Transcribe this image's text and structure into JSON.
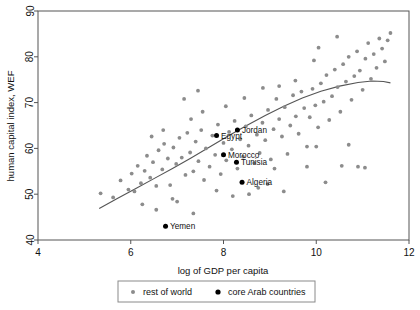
{
  "chart_data": {
    "type": "scatter",
    "title": "",
    "xlabel": "log of GDP per capita",
    "ylabel": "human capital index, WEF",
    "xlim": [
      4,
      12
    ],
    "ylim": [
      40,
      90
    ],
    "xticks": [
      4,
      6,
      8,
      10,
      12
    ],
    "yticks": [
      40,
      50,
      60,
      70,
      80,
      90
    ],
    "grid": false,
    "legend_position": "below-axis",
    "legend": [
      {
        "name": "rest of world",
        "marker": "dot",
        "color": "#8c8c8c",
        "size": 2.0
      },
      {
        "name": "core Arab countries",
        "marker": "dot",
        "color": "#000000",
        "size": 2.6
      }
    ],
    "series": [
      {
        "name": "rest of world",
        "color": "#8c8c8c",
        "points": [
          [
            5.35,
            50.2
          ],
          [
            5.62,
            49.3
          ],
          [
            5.78,
            53.0
          ],
          [
            5.95,
            51.0
          ],
          [
            6.02,
            54.5
          ],
          [
            6.08,
            50.6
          ],
          [
            6.15,
            56.2
          ],
          [
            6.22,
            52.4
          ],
          [
            6.3,
            55.1
          ],
          [
            6.35,
            58.4
          ],
          [
            6.42,
            53.6
          ],
          [
            6.48,
            57.0
          ],
          [
            6.55,
            51.8
          ],
          [
            6.6,
            59.6
          ],
          [
            6.68,
            55.4
          ],
          [
            6.72,
            61.0
          ],
          [
            6.8,
            57.8
          ],
          [
            6.85,
            52.0
          ],
          [
            6.92,
            60.2
          ],
          [
            6.98,
            56.6
          ],
          [
            7.05,
            62.3
          ],
          [
            7.1,
            58.0
          ],
          [
            7.18,
            54.2
          ],
          [
            7.22,
            63.4
          ],
          [
            7.28,
            59.1
          ],
          [
            7.35,
            55.0
          ],
          [
            7.4,
            61.5
          ],
          [
            7.46,
            57.2
          ],
          [
            7.52,
            64.0
          ],
          [
            7.58,
            53.1
          ],
          [
            7.62,
            60.0
          ],
          [
            7.7,
            56.0
          ],
          [
            7.76,
            62.8
          ],
          [
            7.82,
            58.6
          ],
          [
            7.88,
            65.2
          ],
          [
            7.94,
            54.4
          ],
          [
            8.0,
            61.2
          ],
          [
            8.06,
            57.4
          ],
          [
            8.12,
            63.6
          ],
          [
            8.18,
            59.8
          ],
          [
            8.24,
            66.0
          ],
          [
            8.3,
            55.6
          ],
          [
            8.36,
            62.0
          ],
          [
            8.42,
            58.2
          ],
          [
            8.48,
            64.8
          ],
          [
            8.54,
            60.6
          ],
          [
            8.6,
            67.2
          ],
          [
            8.66,
            56.8
          ],
          [
            8.72,
            63.0
          ],
          [
            8.78,
            59.0
          ],
          [
            8.84,
            65.6
          ],
          [
            8.9,
            61.8
          ],
          [
            8.96,
            68.4
          ],
          [
            9.02,
            57.6
          ],
          [
            9.08,
            64.2
          ],
          [
            9.14,
            70.8
          ],
          [
            9.2,
            66.4
          ],
          [
            9.26,
            62.6
          ],
          [
            9.32,
            69.0
          ],
          [
            9.38,
            58.8
          ],
          [
            9.44,
            65.0
          ],
          [
            9.5,
            71.6
          ],
          [
            9.56,
            67.0
          ],
          [
            9.62,
            63.2
          ],
          [
            9.68,
            72.4
          ],
          [
            9.74,
            68.8
          ],
          [
            9.8,
            60.4
          ],
          [
            9.86,
            66.8
          ],
          [
            9.92,
            73.0
          ],
          [
            9.98,
            69.4
          ],
          [
            10.04,
            64.6
          ],
          [
            10.1,
            74.2
          ],
          [
            10.16,
            70.2
          ],
          [
            10.22,
            76.0
          ],
          [
            10.28,
            66.2
          ],
          [
            10.34,
            71.4
          ],
          [
            10.4,
            77.2
          ],
          [
            10.46,
            73.4
          ],
          [
            10.52,
            68.0
          ],
          [
            10.58,
            78.4
          ],
          [
            10.64,
            74.6
          ],
          [
            10.7,
            80.0
          ],
          [
            10.76,
            70.6
          ],
          [
            10.82,
            75.8
          ],
          [
            10.88,
            81.2
          ],
          [
            10.94,
            77.0
          ],
          [
            11.0,
            72.8
          ],
          [
            11.06,
            79.6
          ],
          [
            11.12,
            83.0
          ],
          [
            11.18,
            75.2
          ],
          [
            11.24,
            80.6
          ],
          [
            11.3,
            77.6
          ],
          [
            11.36,
            84.0
          ],
          [
            11.42,
            81.8
          ],
          [
            11.48,
            79.0
          ],
          [
            11.54,
            83.6
          ],
          [
            11.6,
            85.2
          ],
          [
            10.05,
            82.0
          ],
          [
            10.45,
            84.4
          ],
          [
            9.95,
            79.2
          ],
          [
            6.25,
            47.8
          ],
          [
            6.55,
            46.6
          ],
          [
            7.0,
            48.4
          ],
          [
            7.35,
            45.8
          ],
          [
            6.9,
            49.0
          ],
          [
            9.1,
            55.6
          ],
          [
            9.8,
            56.0
          ],
          [
            10.55,
            56.2
          ],
          [
            10.9,
            56.0
          ],
          [
            11.05,
            55.8
          ],
          [
            10.0,
            60.4
          ],
          [
            10.7,
            60.8
          ],
          [
            10.2,
            52.6
          ],
          [
            8.55,
            50.0
          ],
          [
            8.75,
            51.4
          ],
          [
            8.2,
            49.6
          ],
          [
            7.85,
            50.8
          ],
          [
            8.95,
            52.2
          ],
          [
            9.3,
            50.6
          ],
          [
            7.55,
            68.0
          ],
          [
            7.15,
            70.8
          ],
          [
            7.45,
            72.6
          ],
          [
            8.05,
            69.2
          ],
          [
            8.45,
            71.0
          ],
          [
            8.85,
            73.2
          ],
          [
            6.7,
            64.0
          ],
          [
            6.45,
            62.6
          ],
          [
            7.3,
            66.4
          ],
          [
            9.55,
            74.8
          ],
          [
            9.2,
            73.6
          ]
        ]
      },
      {
        "name": "core Arab countries",
        "color": "#000000",
        "points": [
          {
            "label": "Egypt",
            "x": 7.85,
            "y": 62.8,
            "label_pos": "right"
          },
          {
            "label": "Jordan",
            "x": 8.3,
            "y": 64.0,
            "label_pos": "right"
          },
          {
            "label": "Morocco",
            "x": 8.0,
            "y": 58.6,
            "label_pos": "right"
          },
          {
            "label": "Tunisia",
            "x": 8.28,
            "y": 57.0,
            "label_pos": "right"
          },
          {
            "label": "Algeria",
            "x": 8.4,
            "y": 52.6,
            "label_pos": "right"
          },
          {
            "label": "Yemen",
            "x": 6.75,
            "y": 43.0,
            "label_pos": "right"
          }
        ]
      }
    ],
    "fit_curve": {
      "name": "lowess-fit",
      "color": "#555555",
      "points": [
        [
          5.32,
          46.9
        ],
        [
          5.7,
          49.0
        ],
        [
          6.1,
          51.2
        ],
        [
          6.5,
          53.4
        ],
        [
          6.9,
          55.6
        ],
        [
          7.3,
          57.9
        ],
        [
          7.7,
          60.3
        ],
        [
          8.1,
          62.7
        ],
        [
          8.5,
          65.0
        ],
        [
          8.9,
          67.2
        ],
        [
          9.3,
          69.2
        ],
        [
          9.7,
          71.0
        ],
        [
          10.1,
          72.5
        ],
        [
          10.5,
          73.6
        ],
        [
          10.9,
          74.4
        ],
        [
          11.2,
          74.7
        ],
        [
          11.45,
          74.6
        ],
        [
          11.6,
          74.3
        ]
      ]
    }
  }
}
